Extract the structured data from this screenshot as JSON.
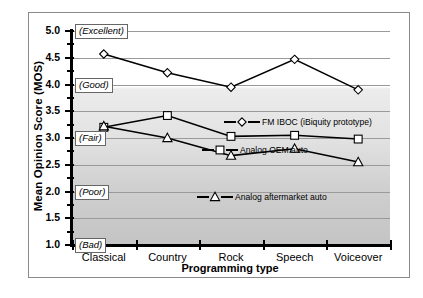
{
  "chart_data": {
    "type": "line",
    "title": "",
    "xlabel": "Programming type",
    "ylabel": "Mean Opinion Score (MOS)",
    "categories": [
      "Classical",
      "Country",
      "Rock",
      "Speech",
      "Voiceover"
    ],
    "ylim": [
      1.0,
      5.0
    ],
    "ytick_labels": [
      "5.0",
      "4.5",
      "4.0",
      "3.5",
      "3.0",
      "2.5",
      "2.0",
      "1.5",
      "1.0"
    ],
    "ytick_values": [
      5.0,
      4.5,
      4.0,
      3.5,
      3.0,
      2.5,
      2.0,
      1.5,
      1.0
    ],
    "grid": true,
    "legend_position": "inline-on-plot",
    "quality_annotations": [
      {
        "label": "(Excellent)",
        "value": 5.0
      },
      {
        "label": "(Good)",
        "value": 4.0
      },
      {
        "label": "(Fair)",
        "value": 3.0
      },
      {
        "label": "(Poor)",
        "value": 2.0
      },
      {
        "label": "(Bad)",
        "value": 1.0
      }
    ],
    "series": [
      {
        "name": "FM IBOC (iBiquity prototype)",
        "marker": "diamond",
        "values": [
          4.57,
          4.22,
          3.95,
          4.47,
          3.9
        ]
      },
      {
        "name": "Analog OEM auto",
        "marker": "square",
        "values": [
          3.2,
          3.42,
          3.03,
          3.05,
          2.98
        ]
      },
      {
        "name": "Analog aftermarket auto",
        "marker": "triangle",
        "values": [
          3.22,
          3.0,
          2.67,
          2.8,
          2.55
        ]
      }
    ]
  },
  "colors": {
    "line": "#000000",
    "marker_fill": "#ffffff",
    "grid": "#9a9a9a",
    "plot_bg_top": "#ffffff",
    "plot_bg_bottom": "#c4c4c4",
    "frame": "#8a8a8a"
  }
}
